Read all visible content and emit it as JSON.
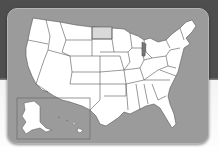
{
  "map": {
    "title": "United States map",
    "highlighted_state": "North Dakota",
    "inset": "Alaska and Hawaii",
    "colors": {
      "background_top": "#4e4e4e",
      "background_bottom": "#f6f6f6",
      "panel": "#9b9b9b",
      "state_fill": "#ffffff",
      "highlight_fill": "#d9d9d9",
      "border": "#555555"
    }
  }
}
